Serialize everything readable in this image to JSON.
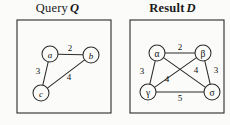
{
  "figure": {
    "background_color": "#fbfbf9",
    "stroke_color": "#2b2b2b",
    "text_color": "#111111"
  },
  "panels": [
    {
      "id": "query",
      "title_text": "Query",
      "title_symbol": "Q",
      "frame": {
        "x": 17,
        "y": 20,
        "width": 94,
        "height": 93
      },
      "nodes": [
        {
          "id": "a",
          "label": "a",
          "script": "latin",
          "cx": 50,
          "cy": 54,
          "r": 8
        },
        {
          "id": "b",
          "label": "b",
          "script": "latin",
          "cx": 91,
          "cy": 55,
          "r": 8
        },
        {
          "id": "c",
          "label": "c",
          "script": "latin",
          "cx": 41,
          "cy": 93,
          "r": 8
        }
      ],
      "edges": [
        {
          "from": "a",
          "to": "b",
          "weight": "2",
          "label_x": 70,
          "label_y": 48
        },
        {
          "from": "a",
          "to": "c",
          "weight": "3",
          "label_x": 38,
          "label_y": 71
        },
        {
          "from": "c",
          "to": "b",
          "weight": "4",
          "label_x": 69,
          "label_y": 77
        }
      ]
    },
    {
      "id": "result",
      "title_text": "Result",
      "title_symbol": "D",
      "frame": {
        "x": 130,
        "y": 20,
        "width": 94,
        "height": 93
      },
      "nodes": [
        {
          "id": "alpha",
          "label": "α",
          "script": "greek",
          "cx": 157,
          "cy": 53,
          "r": 8
        },
        {
          "id": "beta",
          "label": "β",
          "script": "greek",
          "cx": 203,
          "cy": 53,
          "r": 8
        },
        {
          "id": "gamma",
          "label": "γ",
          "script": "greek",
          "cx": 148,
          "cy": 92,
          "r": 8
        },
        {
          "id": "sigma",
          "label": "σ",
          "script": "greek",
          "cx": 212,
          "cy": 92,
          "r": 8
        }
      ],
      "edges": [
        {
          "from": "alpha",
          "to": "beta",
          "weight": "2",
          "label_x": 180,
          "label_y": 47
        },
        {
          "from": "alpha",
          "to": "gamma",
          "weight": "3",
          "label_x": 142,
          "label_y": 71
        },
        {
          "from": "alpha",
          "to": "sigma",
          "weight": "4",
          "label_x": 196,
          "label_y": 70
        },
        {
          "from": "beta",
          "to": "gamma",
          "weight": "4",
          "label_x": 167,
          "label_y": 79
        },
        {
          "from": "beta",
          "to": "sigma",
          "weight": "3",
          "label_x": 216,
          "label_y": 70
        },
        {
          "from": "gamma",
          "to": "sigma",
          "weight": "5",
          "label_x": 180,
          "label_y": 98
        }
      ]
    }
  ]
}
